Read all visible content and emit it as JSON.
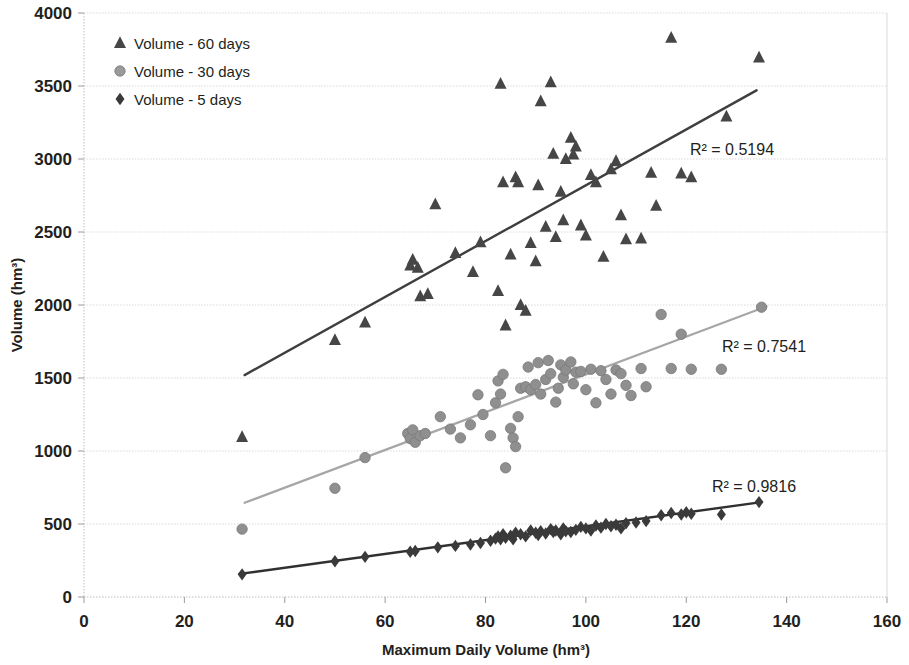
{
  "chart_data": {
    "type": "scatter",
    "title": "",
    "xlabel": "Maximum Daily Volume (hm³)",
    "ylabel": "Volume (hm³)",
    "xlim": [
      0,
      160
    ],
    "ylim": [
      0,
      4000
    ],
    "xticks": [
      "0",
      "20",
      "40",
      "60",
      "80",
      "100",
      "120",
      "140",
      "160"
    ],
    "yticks": [
      "0",
      "500",
      "1000",
      "1500",
      "2000",
      "2500",
      "3000",
      "3500",
      "4000"
    ],
    "grid": "horizontal",
    "legend_position": "top-left",
    "series": [
      {
        "name": "Volume - 60 days",
        "marker": "triangle",
        "color": "#464646",
        "r2_label": "R² = 0.5194",
        "r2_value": 0.5194,
        "trendline": {
          "x1": 32,
          "y1": 1520,
          "x2": 134,
          "y2": 3470,
          "color": "#3f3f3f"
        },
        "points": [
          [
            31.5,
            1095
          ],
          [
            50,
            1760
          ],
          [
            56,
            1880
          ],
          [
            65,
            2270
          ],
          [
            65.5,
            2310
          ],
          [
            66.5,
            2255
          ],
          [
            67,
            2060
          ],
          [
            68.5,
            2075
          ],
          [
            70,
            2690
          ],
          [
            74,
            2355
          ],
          [
            77.5,
            2225
          ],
          [
            79,
            2430
          ],
          [
            82.5,
            2095
          ],
          [
            83,
            3515
          ],
          [
            83.5,
            2840
          ],
          [
            84,
            1860
          ],
          [
            85,
            2345
          ],
          [
            86,
            2875
          ],
          [
            86.5,
            2840
          ],
          [
            87,
            2000
          ],
          [
            88,
            1960
          ],
          [
            89,
            2425
          ],
          [
            90,
            2300
          ],
          [
            90.5,
            2820
          ],
          [
            91,
            3395
          ],
          [
            92,
            2535
          ],
          [
            93,
            3525
          ],
          [
            93.5,
            3035
          ],
          [
            94,
            2465
          ],
          [
            95,
            2775
          ],
          [
            95.5,
            2580
          ],
          [
            96,
            3000
          ],
          [
            97,
            3145
          ],
          [
            97.5,
            3030
          ],
          [
            98,
            3085
          ],
          [
            99,
            2545
          ],
          [
            100,
            2475
          ],
          [
            101,
            2890
          ],
          [
            102,
            2840
          ],
          [
            103.5,
            2330
          ],
          [
            105,
            2930
          ],
          [
            106,
            2985
          ],
          [
            107,
            2615
          ],
          [
            108,
            2450
          ],
          [
            111,
            2455
          ],
          [
            113,
            2905
          ],
          [
            114,
            2680
          ],
          [
            117,
            3830
          ],
          [
            119,
            2900
          ],
          [
            121,
            2875
          ],
          [
            128,
            3290
          ],
          [
            134.5,
            3695
          ]
        ]
      },
      {
        "name": "Volume - 30 days",
        "marker": "circle",
        "color": "#8f8f8f",
        "r2_label": "R² = 0.7541",
        "r2_value": 0.7541,
        "trendline": {
          "x1": 32,
          "y1": 645,
          "x2": 136,
          "y2": 1990,
          "color": "#a6a6a6"
        },
        "points": [
          [
            31.5,
            465
          ],
          [
            50,
            745
          ],
          [
            56,
            955
          ],
          [
            64.5,
            1120
          ],
          [
            65,
            1085
          ],
          [
            65.5,
            1145
          ],
          [
            66,
            1060
          ],
          [
            67,
            1105
          ],
          [
            68,
            1120
          ],
          [
            71,
            1235
          ],
          [
            73,
            1150
          ],
          [
            75,
            1090
          ],
          [
            77,
            1180
          ],
          [
            78.5,
            1385
          ],
          [
            79.5,
            1250
          ],
          [
            81,
            1105
          ],
          [
            82,
            1330
          ],
          [
            82.5,
            1480
          ],
          [
            83,
            1390
          ],
          [
            83.5,
            1525
          ],
          [
            84,
            885
          ],
          [
            85,
            1155
          ],
          [
            85.5,
            1090
          ],
          [
            86,
            1030
          ],
          [
            86.5,
            1235
          ],
          [
            87,
            1430
          ],
          [
            88,
            1440
          ],
          [
            88.5,
            1575
          ],
          [
            89,
            1420
          ],
          [
            90,
            1455
          ],
          [
            90.5,
            1605
          ],
          [
            91,
            1390
          ],
          [
            92,
            1490
          ],
          [
            92.5,
            1620
          ],
          [
            93,
            1530
          ],
          [
            94,
            1335
          ],
          [
            94.5,
            1430
          ],
          [
            95,
            1590
          ],
          [
            95.5,
            1505
          ],
          [
            96,
            1555
          ],
          [
            97,
            1610
          ],
          [
            97.5,
            1460
          ],
          [
            98,
            1540
          ],
          [
            99,
            1545
          ],
          [
            100,
            1420
          ],
          [
            101,
            1560
          ],
          [
            102,
            1330
          ],
          [
            103,
            1550
          ],
          [
            104,
            1490
          ],
          [
            105,
            1390
          ],
          [
            106,
            1555
          ],
          [
            107,
            1530
          ],
          [
            108,
            1450
          ],
          [
            109,
            1380
          ],
          [
            111,
            1565
          ],
          [
            112,
            1440
          ],
          [
            115,
            1935
          ],
          [
            117,
            1565
          ],
          [
            119,
            1800
          ],
          [
            121,
            1560
          ],
          [
            127,
            1560
          ],
          [
            135,
            1985
          ]
        ]
      },
      {
        "name": "Volume - 5 days",
        "marker": "diamond",
        "color": "#3a3a3a",
        "r2_label": "R² = 0.9816",
        "r2_value": 0.9816,
        "trendline": {
          "x1": 31,
          "y1": 158,
          "x2": 135,
          "y2": 650,
          "color": "#303030"
        },
        "points": [
          [
            31.5,
            155
          ],
          [
            50,
            245
          ],
          [
            56,
            275
          ],
          [
            65,
            310
          ],
          [
            66,
            315
          ],
          [
            70.5,
            340
          ],
          [
            74,
            350
          ],
          [
            77,
            360
          ],
          [
            79,
            370
          ],
          [
            81,
            385
          ],
          [
            82,
            400
          ],
          [
            82.5,
            415
          ],
          [
            83,
            395
          ],
          [
            83.5,
            430
          ],
          [
            84,
            405
          ],
          [
            85,
            420
          ],
          [
            85.5,
            395
          ],
          [
            86,
            440
          ],
          [
            87,
            430
          ],
          [
            88,
            415
          ],
          [
            89,
            455
          ],
          [
            90,
            440
          ],
          [
            90.5,
            425
          ],
          [
            91,
            450
          ],
          [
            92,
            435
          ],
          [
            93,
            465
          ],
          [
            93.5,
            445
          ],
          [
            94,
            455
          ],
          [
            95,
            430
          ],
          [
            95.5,
            470
          ],
          [
            96,
            450
          ],
          [
            97,
            445
          ],
          [
            98,
            460
          ],
          [
            99,
            480
          ],
          [
            100,
            470
          ],
          [
            101,
            455
          ],
          [
            102,
            490
          ],
          [
            103,
            475
          ],
          [
            104,
            500
          ],
          [
            105,
            485
          ],
          [
            106,
            495
          ],
          [
            107,
            470
          ],
          [
            108,
            505
          ],
          [
            110,
            510
          ],
          [
            112,
            520
          ],
          [
            115,
            560
          ],
          [
            117,
            575
          ],
          [
            119,
            565
          ],
          [
            120,
            580
          ],
          [
            121,
            570
          ],
          [
            127,
            565
          ],
          [
            134.5,
            650
          ]
        ]
      }
    ]
  },
  "axes": {
    "y_title": "Volume  (hm³)",
    "x_title": "Maximum Daily Volume (hm³)"
  },
  "legend": {
    "items": [
      {
        "label": "Volume - 60 days",
        "marker": "triangle-marker",
        "color": "#464646"
      },
      {
        "label": "Volume - 30 days",
        "marker": "circle-marker",
        "color": "#9a9a9a"
      },
      {
        "label": "Volume - 5 days",
        "marker": "diamond-marker",
        "color": "#3a3a3a"
      }
    ]
  },
  "annotations": [
    {
      "name": "r2-60-days",
      "text": "R² = 0.5194",
      "x": 690,
      "y": 155
    },
    {
      "name": "r2-30-days",
      "text": "R² = 0.7541",
      "x": 722,
      "y": 352
    },
    {
      "name": "r2-5-days",
      "text": "R² = 0.9816",
      "x": 712,
      "y": 492
    }
  ]
}
